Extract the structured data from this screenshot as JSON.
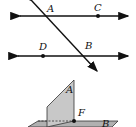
{
  "figure_top": {
    "description": "Two parallel lines cut by a transversal",
    "points": [
      {
        "label": "A",
        "x": 49,
        "y": 10
      },
      {
        "label": "C",
        "x": 96,
        "y": 10
      },
      {
        "label": "D",
        "x": 40,
        "y": 50
      },
      {
        "label": "B",
        "x": 86,
        "y": 48
      }
    ],
    "colors": {
      "line": "#111111",
      "arrow": "#111111"
    }
  },
  "figure_bottom": {
    "description": "Two intersecting planes",
    "planes": [
      {
        "label": "A",
        "orientation": "vertical",
        "color": "#c8c8c8"
      },
      {
        "label": "B",
        "orientation": "horizontal",
        "color": "#b0b0b0"
      }
    ],
    "intersection_point": {
      "label": "F"
    }
  }
}
